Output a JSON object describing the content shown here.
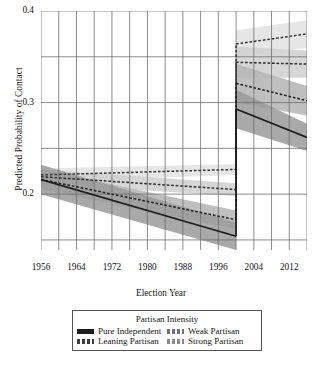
{
  "chart_data": {
    "type": "line",
    "title": "",
    "xlabel": "Election Year",
    "ylabel": "Predicted Probability of Contact",
    "xlim": [
      1956,
      2016
    ],
    "ylim": [
      0.139,
      0.4
    ],
    "ytick_labels": [
      "0.4",
      "0.3",
      "0.2"
    ],
    "ytick_values": [
      0.4,
      0.3,
      0.2
    ],
    "yminor_values": [
      0.35,
      0.25,
      0.15
    ],
    "xtick_labels": [
      "1956",
      "1964",
      "1972",
      "1980",
      "1988",
      "1996",
      "2004",
      "2012"
    ],
    "xtick_values": [
      1956,
      1964,
      1972,
      1980,
      1988,
      1996,
      2004,
      2012
    ],
    "xminor_values": [
      1960,
      1968,
      1976,
      1984,
      1992,
      2000,
      2008,
      2016
    ],
    "grid": true,
    "legend_position": "below-plot",
    "legend_title": "Partisan Intensity",
    "breakpoint_year": 2000,
    "series": [
      {
        "name": "Pure Independent",
        "style": "solid",
        "color": "#1c1c1c",
        "band_color": "#9a9a9a",
        "x": [
          1956,
          2000,
          2000,
          2016
        ],
        "values": [
          0.216,
          0.154,
          0.293,
          0.262
        ],
        "band_lower": [
          0.2,
          0.139,
          0.272,
          0.247
        ],
        "band_upper": [
          0.232,
          0.169,
          0.314,
          0.277
        ]
      },
      {
        "name": "Leaning Partisan",
        "style": "dashed",
        "color": "#1c1c1c",
        "band_color": "#b4b4b4",
        "x": [
          1956,
          2000,
          2000,
          2016
        ],
        "values": [
          0.216,
          0.172,
          0.321,
          0.302
        ],
        "band_lower": [
          0.205,
          0.162,
          0.3,
          0.286
        ],
        "band_upper": [
          0.227,
          0.182,
          0.342,
          0.318
        ]
      },
      {
        "name": "Weak Partisan",
        "style": "dashed",
        "color": "#2a2a2a",
        "band_color": "#cfcfcf",
        "x": [
          1956,
          2000,
          2000,
          2016
        ],
        "values": [
          0.219,
          0.205,
          0.344,
          0.342
        ],
        "band_lower": [
          0.211,
          0.198,
          0.327,
          0.327
        ],
        "band_upper": [
          0.227,
          0.212,
          0.361,
          0.357
        ]
      },
      {
        "name": "Strong Partisan",
        "style": "dashed",
        "color": "#333333",
        "band_color": "#e2e2e2",
        "x": [
          1956,
          2000,
          2000,
          2016
        ],
        "values": [
          0.221,
          0.227,
          0.364,
          0.375
        ],
        "band_lower": [
          0.214,
          0.221,
          0.349,
          0.36
        ],
        "band_upper": [
          0.228,
          0.233,
          0.379,
          0.39
        ]
      }
    ]
  },
  "axis": {
    "y_title": "Predicted Probability of Contact",
    "x_title": "Election Year"
  },
  "legend": {
    "title": "Partisan Intensity",
    "items": [
      {
        "label": "Pure Independent",
        "style": "solid",
        "color": "#1c1c1c"
      },
      {
        "label": "Weak Partisan",
        "style": "dashed",
        "color": "#6e6e6e"
      },
      {
        "label": "Leaning Partisan",
        "style": "dashed",
        "color": "#3c3c3c"
      },
      {
        "label": "Strong Partisan",
        "style": "dashed",
        "color": "#8a8a8a"
      }
    ]
  }
}
